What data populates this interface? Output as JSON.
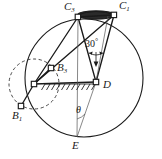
{
  "figure": {
    "type": "geometric-kinematic-diagram",
    "background_color": "#ffffff",
    "stroke_color": "#1a1a1a",
    "width": 162,
    "height": 159,
    "labels": {
      "c_top": {
        "base": "C",
        "sub": "3"
      },
      "c_right": {
        "base": "C",
        "sub": "1"
      },
      "b_mid": {
        "base": "B",
        "sub": "3"
      },
      "b_low": {
        "base": "B",
        "sub": "1"
      },
      "d": {
        "base": "D",
        "sub": ""
      },
      "e": {
        "base": "E",
        "sub": ""
      },
      "angle_30": "30",
      "degree_symbol": "°",
      "theta": "θ"
    },
    "points": {
      "C3": {
        "x": 78,
        "y": 17
      },
      "C1": {
        "x": 114,
        "y": 15
      },
      "B3": {
        "x": 51,
        "y": 68
      },
      "B1": {
        "x": 21,
        "y": 106
      },
      "A": {
        "x": 34,
        "y": 84
      },
      "D": {
        "x": 96,
        "y": 82
      },
      "E": {
        "x": 77,
        "y": 137
      }
    },
    "main_circle": {
      "cx": 84,
      "cy": 78,
      "r": 59
    },
    "dashed_circle": {
      "cx": 34,
      "cy": 84,
      "r": 25
    },
    "top_lens": {
      "cx": 96,
      "cy": 15,
      "rx": 19,
      "ry": 4
    },
    "ground_hatch": {
      "x1": 45,
      "x2": 96,
      "y": 84,
      "ticks": 11
    }
  }
}
